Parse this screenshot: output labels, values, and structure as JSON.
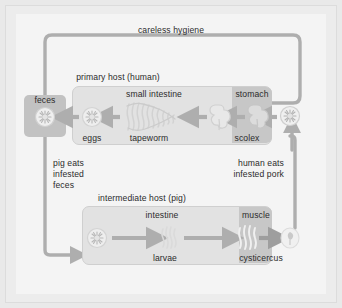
{
  "figure": {
    "background_color": "#f4f4f4",
    "frame_color": "#e9e9e9",
    "stroke_color": "#b0b0b0",
    "box_fill": "#e2e2e2",
    "box_border": "#cfcfcf",
    "dark_fill": "#c7c7c7",
    "feces_fill": "#c2c2c2",
    "text_color": "#2b2b2b"
  },
  "labels": {
    "careless_hygiene": "careless hygiene",
    "primary_host": "primary host (human)",
    "small_intestine": "small intestine",
    "stomach": "stomach",
    "feces": "feces",
    "eggs": "eggs",
    "tapeworm": "tapeworm",
    "scolex": "scolex",
    "pig_eats": "pig eats\ninfested\nfeces",
    "pig_eats_line1": "pig eats",
    "pig_eats_line2": "infested",
    "pig_eats_line3": "feces",
    "human_eats_line1": "human eats",
    "human_eats_line2": "infested pork",
    "intermediate_host": "intermediate host (pig)",
    "intestine": "intestine",
    "muscle": "muscle",
    "larvae": "larvae",
    "cysticercus": "cysticercus"
  },
  "icons": {
    "egg_feces": "egg-burst-icon",
    "egg_human": "egg-burst-icon",
    "tapeworm": "tapeworm-coil-icon",
    "scolex_left": "scolex-head-icon",
    "scolex_right": "scolex-head-icon",
    "egg_stomach": "egg-burst-icon",
    "egg_pig": "egg-burst-icon",
    "larvae": "larvae-squiggle-icon",
    "larvae_muscle": "larvae-squiggle-icon",
    "cysticercus": "cysticercus-bladder-icon"
  },
  "flow": {
    "steps": [
      "eggs in small intestine",
      "eggs pass into feces",
      "pig eats infested feces",
      "eggs in pig intestine",
      "larvae develop",
      "larvae migrate to muscle",
      "cysticercus forms",
      "human eats infested pork",
      "scolex in stomach",
      "scolex attaches in small intestine",
      "tapeworm grows",
      "eggs produced"
    ],
    "loop_label": "careless hygiene"
  }
}
